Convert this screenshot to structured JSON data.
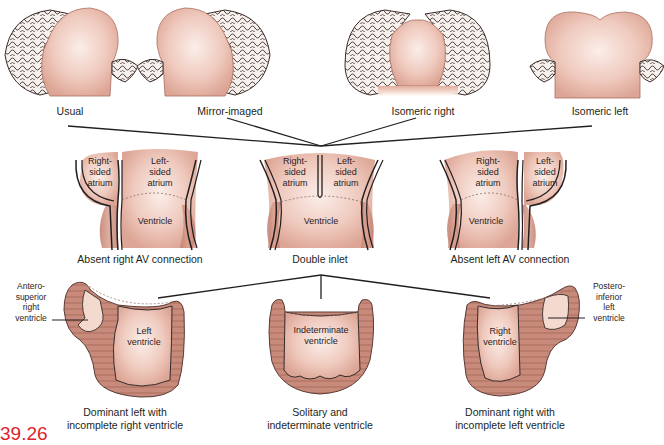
{
  "figure": {
    "number": "39.26",
    "accent_color": "#d9262b",
    "tissue_color": "#e7b7a8",
    "wall_color": "#c98c7c",
    "line_color": "#231f20"
  },
  "row1_atrial_arrangements": [
    {
      "id": "usual",
      "label": "Usual"
    },
    {
      "id": "mirror",
      "label": "Mirror-imaged"
    },
    {
      "id": "isomeric-right",
      "label": "Isomeric right"
    },
    {
      "id": "isomeric-left",
      "label": "Isomeric left"
    }
  ],
  "row2_connections": [
    {
      "id": "absent-right-av",
      "caption": "Absent right AV connection",
      "chambers": {
        "right_atrium": "Right-\nsided\natrium",
        "left_atrium": "Left-\nsided\natrium",
        "ventricle": "Ventricle"
      }
    },
    {
      "id": "double-inlet",
      "caption": "Double inlet",
      "chambers": {
        "right_atrium": "Right-\nsided\natrium",
        "left_atrium": "Left-\nsided\natrium",
        "ventricle": "Ventricle"
      }
    },
    {
      "id": "absent-left-av",
      "caption": "Absent left AV connection",
      "chambers": {
        "right_atrium": "Right-\nsided\natrium",
        "left_atrium": "Left-\nsided\natrium",
        "ventricle": "Ventricle"
      }
    }
  ],
  "row3_ventricular_morphology": [
    {
      "id": "dominant-left",
      "caption": "Dominant left with\nincomplete right ventricle",
      "main_chamber": "Left\nventricle",
      "side_label": "Antero-\nsuperior\nright\nventricle"
    },
    {
      "id": "solitary",
      "caption": "Solitary and\nindeterminate ventricle",
      "main_chamber": "Indeterminate\nventricle"
    },
    {
      "id": "dominant-right",
      "caption": "Dominant right with\nincomplete left ventricle",
      "main_chamber": "Right\nventricle",
      "side_label": "Postero-\ninferior\nleft\nventricle"
    }
  ]
}
